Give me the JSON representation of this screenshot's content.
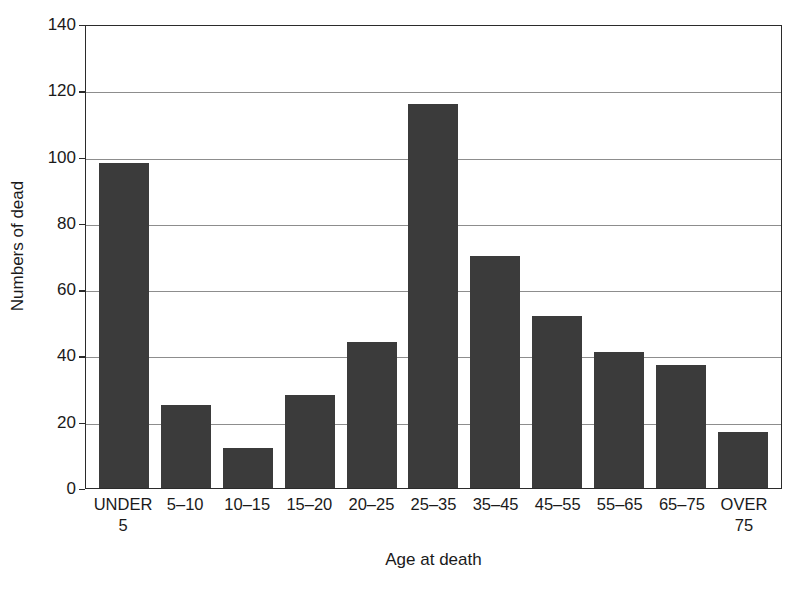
{
  "chart_data": {
    "type": "bar",
    "title": "",
    "xlabel": "Age at death",
    "ylabel": "Numbers of dead",
    "categories": [
      "UNDER\n5",
      "5–10",
      "10–15",
      "15–20",
      "20–25",
      "25–35",
      "35–45",
      "45–55",
      "55–65",
      "65–75",
      "OVER\n75"
    ],
    "values": [
      98,
      25,
      12,
      28,
      44,
      116,
      70,
      52,
      41,
      37,
      17
    ],
    "ylim": [
      0,
      140
    ],
    "yticks": [
      0,
      20,
      40,
      60,
      80,
      100,
      120,
      140
    ],
    "ytick_labels": [
      "0",
      "20",
      "40",
      "60",
      "80",
      "100",
      "120",
      "140"
    ],
    "grid": "horizontal",
    "legend": "none",
    "bar_color": "#3b3b3b",
    "gridline_color": "#8d8d8d",
    "axis_color": "#2b2b2b",
    "background_color": "#ffffff"
  }
}
